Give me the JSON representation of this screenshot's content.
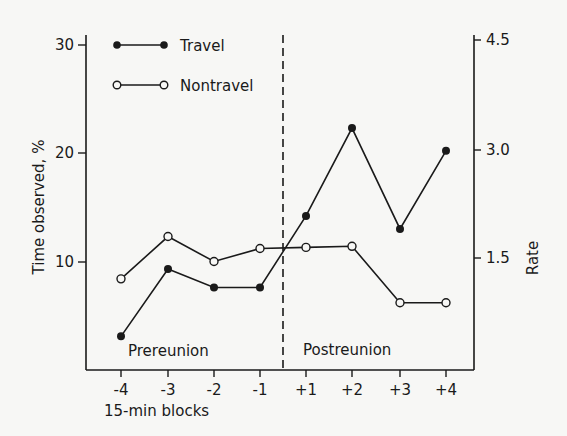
{
  "chart_data": {
    "type": "line",
    "title": "",
    "xlabel": "15-min blocks",
    "ylabel": "Time observed, %",
    "ylabel_right": "Rate",
    "categories": [
      "-4",
      "-3",
      "-2",
      "-1",
      "+1",
      "+2",
      "+3",
      "+4"
    ],
    "series": [
      {
        "name": "Travel",
        "marker": "filled-circle",
        "values": [
          3.1,
          9.3,
          7.6,
          7.6,
          14.2,
          22.3,
          13.0,
          20.2
        ]
      },
      {
        "name": "Nontravel",
        "marker": "open-circle",
        "values": [
          8.4,
          12.3,
          10.0,
          11.2,
          11.3,
          11.4,
          6.2,
          6.2
        ]
      }
    ],
    "ylim": [
      0,
      30
    ],
    "yticks": [
      "10",
      "20",
      "30"
    ],
    "ylim_right": [
      0,
      4.5
    ],
    "yticks_right": [
      "1.5",
      "3.0",
      "4.5"
    ],
    "grid": false,
    "legend_position": "top-left",
    "annotations": {
      "divider": "dashed vertical line between -1 and +1",
      "left_region": "Prereunion",
      "right_region": "Postreunion"
    }
  },
  "legend": {
    "travel": "Travel",
    "nontravel": "Nontravel"
  },
  "regions": {
    "pre": "Prereunion",
    "post": "Postreunion"
  },
  "axes": {
    "x_title": "15-min blocks",
    "y_left_title": "Time observed, %",
    "y_right_title": "Rate",
    "x_ticks": [
      "-4",
      "-3",
      "-2",
      "-1",
      "+1",
      "+2",
      "+3",
      "+4"
    ],
    "y_left_ticks": [
      "10",
      "20",
      "30"
    ],
    "y_right_ticks": [
      "1.5",
      "3.0",
      "4.5"
    ]
  }
}
